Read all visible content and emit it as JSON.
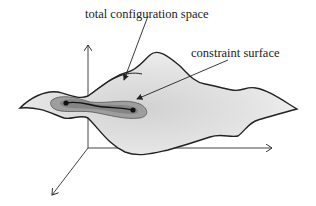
{
  "diagram": {
    "labels": {
      "total_space": "total configuration space",
      "constraint_surface": "constraint surface"
    },
    "axes": [
      "vertical-axis",
      "horizontal-axis",
      "depth-axis"
    ],
    "colors": {
      "surface_fill": "#e4e4e4",
      "surface_shadow": "#cfcfcf",
      "constraint_outer": "#a9a9a9",
      "constraint_inner": "#7e7e7e",
      "line": "#222222"
    },
    "points": [
      "start-point",
      "end-point"
    ]
  }
}
